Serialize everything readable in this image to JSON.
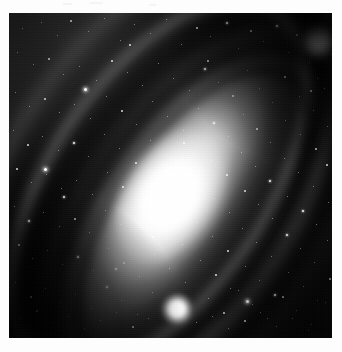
{
  "page": {
    "background_color": "#fdfdfd",
    "caption": ""
  },
  "plate": {
    "name": "galaxy-plate",
    "frame": {
      "x": 9,
      "y": 13,
      "width": 323,
      "height": 325
    },
    "background_color": "#000000",
    "medium": "grayscale astronomical photographic plate",
    "subject": "spiral galaxy",
    "orientation_degrees": -56
  },
  "objects": {
    "main_galaxy": {
      "label": "spiral galaxy disc",
      "nucleus_x": 170,
      "nucleus_y": 196,
      "major_axis_px": 430,
      "minor_axis_px": 166,
      "position_angle_deg": -56,
      "core_color": "#ffffff",
      "disc_color": "#d4d4d4",
      "dust_lane_color": "#121212"
    },
    "companion_galaxy": {
      "label": "companion elliptical galaxy",
      "x": 320,
      "y": 43,
      "diameter_px": 44,
      "core_color": "#ffffff"
    },
    "foreground_star": {
      "label": "bright foreground star",
      "x": 177,
      "y": 309,
      "diameter_px": 40,
      "color": "#ffffff"
    }
  },
  "starfield": {
    "label": "resolved star field",
    "star_color": "#ffffff",
    "stars": [
      [
        22,
        28,
        1
      ],
      [
        41,
        22,
        1
      ],
      [
        57,
        35,
        1
      ],
      [
        70,
        20,
        2
      ],
      [
        88,
        31,
        1
      ],
      [
        104,
        18,
        1
      ],
      [
        120,
        40,
        1
      ],
      [
        134,
        24,
        1
      ],
      [
        150,
        33,
        1
      ],
      [
        166,
        19,
        1
      ],
      [
        181,
        44,
        1
      ],
      [
        196,
        27,
        2
      ],
      [
        210,
        36,
        1
      ],
      [
        226,
        22,
        3
      ],
      [
        238,
        48,
        1
      ],
      [
        250,
        30,
        2
      ],
      [
        263,
        41,
        1
      ],
      [
        276,
        25,
        3
      ],
      [
        288,
        52,
        1
      ],
      [
        296,
        34,
        2
      ],
      [
        309,
        62,
        1
      ],
      [
        317,
        78,
        1
      ],
      [
        326,
        30,
        1
      ],
      [
        331,
        54,
        1
      ],
      [
        17,
        52,
        1
      ],
      [
        33,
        64,
        1
      ],
      [
        48,
        58,
        2
      ],
      [
        63,
        74,
        1
      ],
      [
        79,
        66,
        1
      ],
      [
        96,
        80,
        1
      ],
      [
        111,
        60,
        2
      ],
      [
        127,
        72,
        1
      ],
      [
        142,
        85,
        1
      ],
      [
        158,
        63,
        1
      ],
      [
        173,
        78,
        1
      ],
      [
        189,
        90,
        1
      ],
      [
        204,
        68,
        3
      ],
      [
        218,
        82,
        1
      ],
      [
        232,
        95,
        2
      ],
      [
        247,
        70,
        1
      ],
      [
        259,
        88,
        1
      ],
      [
        272,
        102,
        1
      ],
      [
        284,
        76,
        2
      ],
      [
        299,
        96,
        1
      ],
      [
        313,
        110,
        1
      ],
      [
        324,
        88,
        1
      ],
      [
        15,
        92,
        1
      ],
      [
        29,
        106,
        1
      ],
      [
        44,
        98,
        2
      ],
      [
        59,
        112,
        1
      ],
      [
        74,
        104,
        1
      ],
      [
        90,
        118,
        1
      ],
      [
        106,
        96,
        1
      ],
      [
        121,
        110,
        2
      ],
      [
        136,
        124,
        1
      ],
      [
        152,
        101,
        1
      ],
      [
        167,
        116,
        1
      ],
      [
        183,
        130,
        1
      ],
      [
        198,
        108,
        1
      ],
      [
        213,
        122,
        3
      ],
      [
        228,
        136,
        1
      ],
      [
        243,
        114,
        1
      ],
      [
        256,
        128,
        2
      ],
      [
        270,
        142,
        1
      ],
      [
        285,
        120,
        1
      ],
      [
        300,
        134,
        1
      ],
      [
        315,
        148,
        2
      ],
      [
        327,
        126,
        1
      ],
      [
        13,
        130,
        1
      ],
      [
        27,
        144,
        2
      ],
      [
        42,
        136,
        1
      ],
      [
        58,
        150,
        1
      ],
      [
        73,
        142,
        3
      ],
      [
        88,
        156,
        1
      ],
      [
        104,
        134,
        1
      ],
      [
        119,
        148,
        1
      ],
      [
        135,
        162,
        2
      ],
      [
        150,
        140,
        1
      ],
      [
        165,
        154,
        1
      ],
      [
        181,
        168,
        1
      ],
      [
        196,
        146,
        1
      ],
      [
        211,
        160,
        1
      ],
      [
        226,
        174,
        2
      ],
      [
        241,
        152,
        1
      ],
      [
        255,
        166,
        1
      ],
      [
        269,
        180,
        3
      ],
      [
        284,
        158,
        1
      ],
      [
        298,
        172,
        1
      ],
      [
        313,
        186,
        1
      ],
      [
        326,
        164,
        2
      ],
      [
        16,
        168,
        2
      ],
      [
        31,
        182,
        1
      ],
      [
        46,
        174,
        1
      ],
      [
        61,
        188,
        1
      ],
      [
        76,
        180,
        1
      ],
      [
        92,
        194,
        1
      ],
      [
        107,
        172,
        1
      ],
      [
        122,
        186,
        2
      ],
      [
        138,
        200,
        1
      ],
      [
        153,
        178,
        1
      ],
      [
        168,
        192,
        1
      ],
      [
        184,
        206,
        1
      ],
      [
        199,
        184,
        1
      ],
      [
        214,
        198,
        1
      ],
      [
        229,
        212,
        1
      ],
      [
        244,
        190,
        2
      ],
      [
        258,
        204,
        1
      ],
      [
        272,
        218,
        1
      ],
      [
        287,
        196,
        1
      ],
      [
        302,
        210,
        3
      ],
      [
        316,
        224,
        1
      ],
      [
        328,
        202,
        1
      ],
      [
        14,
        206,
        1
      ],
      [
        28,
        220,
        3
      ],
      [
        43,
        212,
        1
      ],
      [
        59,
        226,
        1
      ],
      [
        74,
        218,
        2
      ],
      [
        89,
        232,
        1
      ],
      [
        105,
        210,
        1
      ],
      [
        120,
        224,
        1
      ],
      [
        136,
        238,
        1
      ],
      [
        151,
        216,
        2
      ],
      [
        166,
        230,
        1
      ],
      [
        182,
        244,
        1
      ],
      [
        197,
        222,
        1
      ],
      [
        212,
        236,
        1
      ],
      [
        227,
        250,
        2
      ],
      [
        242,
        228,
        1
      ],
      [
        256,
        242,
        1
      ],
      [
        271,
        256,
        1
      ],
      [
        286,
        234,
        3
      ],
      [
        300,
        248,
        1
      ],
      [
        314,
        262,
        1
      ],
      [
        327,
        240,
        1
      ],
      [
        18,
        244,
        2
      ],
      [
        32,
        258,
        1
      ],
      [
        47,
        250,
        1
      ],
      [
        62,
        264,
        1
      ],
      [
        77,
        256,
        3
      ],
      [
        93,
        270,
        1
      ],
      [
        108,
        248,
        1
      ],
      [
        123,
        262,
        2
      ],
      [
        139,
        276,
        1
      ],
      [
        154,
        254,
        1
      ],
      [
        169,
        268,
        1
      ],
      [
        185,
        282,
        1
      ],
      [
        200,
        260,
        1
      ],
      [
        215,
        274,
        2
      ],
      [
        230,
        288,
        1
      ],
      [
        245,
        266,
        1
      ],
      [
        259,
        280,
        1
      ],
      [
        274,
        294,
        3
      ],
      [
        288,
        272,
        1
      ],
      [
        303,
        286,
        1
      ],
      [
        317,
        300,
        1
      ],
      [
        329,
        278,
        2
      ],
      [
        15,
        282,
        1
      ],
      [
        30,
        296,
        2
      ],
      [
        45,
        288,
        1
      ],
      [
        60,
        302,
        1
      ],
      [
        75,
        294,
        1
      ],
      [
        91,
        308,
        1
      ],
      [
        106,
        286,
        3
      ],
      [
        121,
        300,
        1
      ],
      [
        137,
        314,
        1
      ],
      [
        152,
        292,
        1
      ],
      [
        208,
        298,
        1
      ],
      [
        223,
        312,
        2
      ],
      [
        238,
        290,
        1
      ],
      [
        252,
        304,
        1
      ],
      [
        267,
        318,
        1
      ],
      [
        282,
        296,
        2
      ],
      [
        296,
        310,
        1
      ],
      [
        311,
        324,
        1
      ],
      [
        325,
        302,
        1
      ],
      [
        20,
        318,
        1
      ],
      [
        36,
        310,
        2
      ],
      [
        52,
        322,
        1
      ],
      [
        68,
        316,
        1
      ],
      [
        84,
        328,
        1
      ],
      [
        100,
        320,
        1
      ],
      [
        116,
        312,
        1
      ],
      [
        132,
        326,
        2
      ],
      [
        148,
        318,
        1
      ],
      [
        196,
        322,
        1
      ],
      [
        212,
        316,
        1
      ],
      [
        228,
        328,
        1
      ],
      [
        244,
        320,
        2
      ],
      [
        260,
        312,
        1
      ],
      [
        276,
        326,
        1
      ],
      [
        292,
        318,
        1
      ],
      [
        308,
        330,
        1
      ],
      [
        84,
        88,
        4
      ],
      [
        183,
        142,
        2
      ],
      [
        246,
        300,
        4
      ],
      [
        129,
        44,
        2
      ],
      [
        310,
        90,
        2
      ],
      [
        63,
        196,
        3
      ],
      [
        44,
        168,
        4
      ],
      [
        152,
        236,
        2
      ],
      [
        115,
        268,
        3
      ],
      [
        207,
        60,
        2
      ]
    ]
  }
}
